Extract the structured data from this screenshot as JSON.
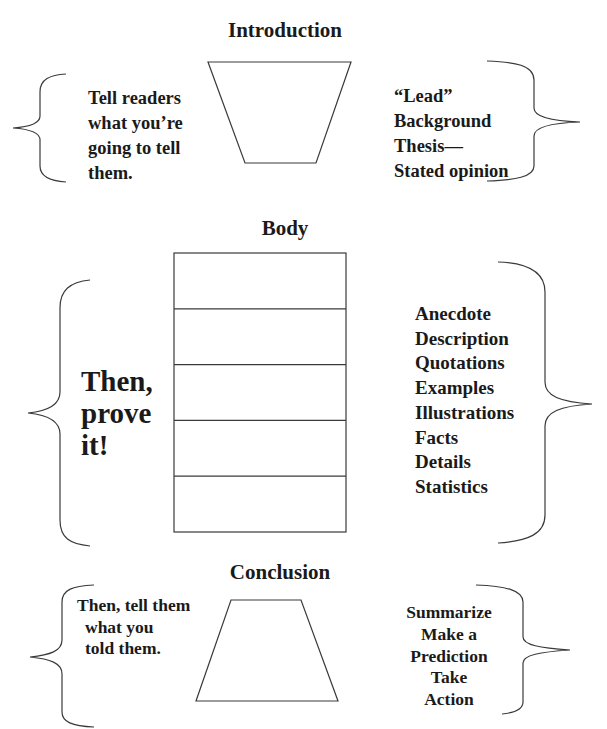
{
  "introduction": {
    "heading": "Introduction",
    "left_text": [
      "Tell readers",
      "what you’re",
      "going to tell",
      "them."
    ],
    "right_text": [
      "“Lead”",
      "Background",
      "Thesis—",
      "Stated opinion"
    ]
  },
  "body": {
    "heading": "Body",
    "left_text": [
      "Then,",
      "prove",
      "it!"
    ],
    "paragraph_rows": 5,
    "right_list": [
      "Anecdote",
      "Description",
      "Quotations",
      "Examples",
      "Illustrations",
      "Facts",
      "Details",
      "Statistics"
    ]
  },
  "conclusion": {
    "heading": "Conclusion",
    "left_text": [
      "Then, tell them",
      "what you",
      "told them."
    ],
    "right_text": [
      "Summarize",
      "Make a",
      "Prediction",
      "Take",
      "Action"
    ]
  },
  "colors": {
    "line": "#3a3a3a",
    "text": "#1a1a1a",
    "background": "#ffffff"
  }
}
